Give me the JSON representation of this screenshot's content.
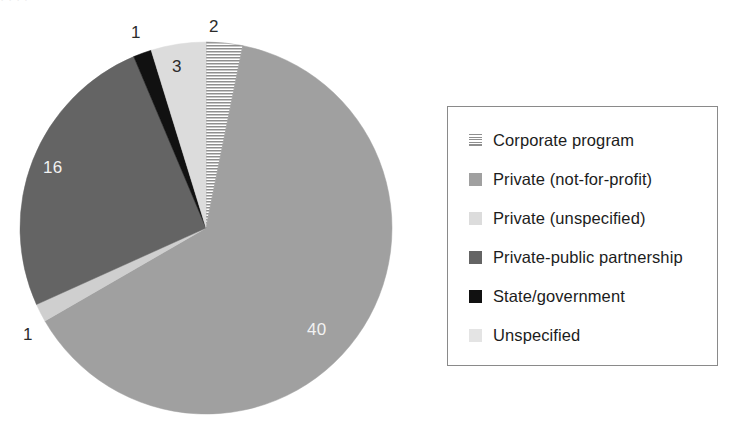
{
  "chart_data": {
    "type": "pie",
    "title": "",
    "total": 63,
    "categories": [
      "Corporate program",
      "Private (not-for-profit)",
      "Unspecified",
      "Private-public partnership",
      "State/government",
      "Private (unspecified)"
    ],
    "values": [
      2,
      40,
      1,
      16,
      1,
      3
    ],
    "labels_shown": [
      "2",
      "40",
      "1",
      "16",
      "1",
      "3"
    ],
    "legend_position": "right",
    "grid": false,
    "start_angle_deg": 0,
    "direction": "clockwise",
    "slices": [
      {
        "label": "Corporate program",
        "value": 2,
        "data_label": "2",
        "fill": "hatch",
        "color": "#8f8f8f",
        "start_deg": 0.0,
        "end_deg": 11.43,
        "label_color": "dark",
        "label_placement": "outside"
      },
      {
        "label": "Private (not-for-profit)",
        "value": 40,
        "data_label": "40",
        "fill": "solid",
        "color": "#a0a0a0",
        "start_deg": 11.43,
        "end_deg": 240.0,
        "label_color": "light",
        "label_placement": "inside"
      },
      {
        "label": "Unspecified",
        "value": 1,
        "data_label": "1",
        "fill": "solid",
        "color": "#cfcfcf",
        "start_deg": 240.0,
        "end_deg": 245.71,
        "label_color": "dark",
        "label_placement": "outside"
      },
      {
        "label": "Private-public partnership",
        "value": 16,
        "data_label": "16",
        "fill": "solid",
        "color": "#646464",
        "start_deg": 245.71,
        "end_deg": 337.14,
        "label_color": "light",
        "label_placement": "inside"
      },
      {
        "label": "State/government",
        "value": 1,
        "data_label": "1",
        "fill": "solid",
        "color": "#111111",
        "start_deg": 337.14,
        "end_deg": 342.86,
        "label_color": "dark",
        "label_placement": "outside"
      },
      {
        "label": "Private (unspecified)",
        "value": 3,
        "data_label": "3",
        "fill": "solid",
        "color": "#dcdcdc",
        "start_deg": 342.86,
        "end_deg": 360.0,
        "label_color": "dark",
        "label_placement": "inside"
      }
    ]
  },
  "pie": {
    "center_x": 206,
    "center_y": 228,
    "radius": 186,
    "data_labels": [
      {
        "text": "2",
        "x": 209,
        "y": 18,
        "tone": "dark"
      },
      {
        "text": "1",
        "x": 131,
        "y": 24,
        "tone": "dark"
      },
      {
        "text": "3",
        "x": 172,
        "y": 58,
        "tone": "dark"
      },
      {
        "text": "16",
        "x": 43,
        "y": 159,
        "tone": "light"
      },
      {
        "text": "1",
        "x": 23,
        "y": 326,
        "tone": "dark"
      },
      {
        "text": "40",
        "x": 307,
        "y": 321,
        "tone": "light"
      }
    ]
  },
  "legend": {
    "border_color": "#8a8a8a",
    "items": [
      {
        "label": "Corporate program",
        "swatch": "hatch",
        "color": "#8f8f8f"
      },
      {
        "label": "Private (not-for-profit)",
        "swatch": "solid",
        "color": "#a0a0a0"
      },
      {
        "label": "Private (unspecified)",
        "swatch": "solid",
        "color": "#dcdcdc"
      },
      {
        "label": "Private-public partnership",
        "swatch": "solid",
        "color": "#646464"
      },
      {
        "label": "State/government",
        "swatch": "solid",
        "color": "#111111"
      },
      {
        "label": "Unspecified",
        "swatch": "solid",
        "color": "#e4e4e4"
      }
    ]
  },
  "artifacts": {
    "top_clipped_text": "·   ·        ·            ·"
  }
}
